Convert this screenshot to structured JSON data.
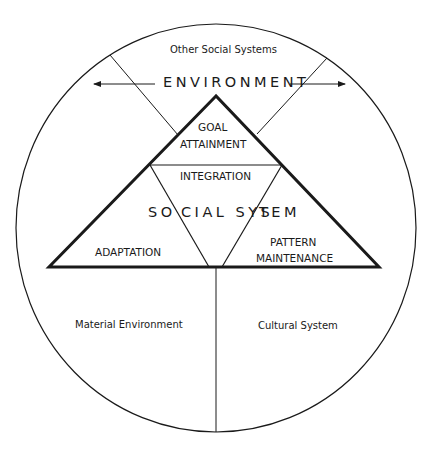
{
  "diagram": {
    "type": "AGIL social system diagram",
    "outer_circle": {
      "regions": [
        {
          "id": "top",
          "label": "Other Social Systems"
        },
        {
          "id": "bottom-left",
          "label": "Material Environment"
        },
        {
          "id": "bottom-right",
          "label": "Cultural System"
        }
      ]
    },
    "environment_label": "ENVIRONMENT",
    "triangle": {
      "center_label_left": "SO",
      "center_label_mid": "CIAL SYS",
      "center_label_right": "TEM",
      "full_center_label": "SOCIAL SYSTEM",
      "sections": {
        "top_line1": "GOAL",
        "top_line2": "ATTAINMENT",
        "center": "INTEGRATION",
        "left": "ADAPTATION",
        "right_line1": "PATTERN",
        "right_line2": "MAINTENANCE"
      }
    },
    "colors": {
      "line": "#1a1a1a",
      "background": "#ffffff"
    }
  }
}
